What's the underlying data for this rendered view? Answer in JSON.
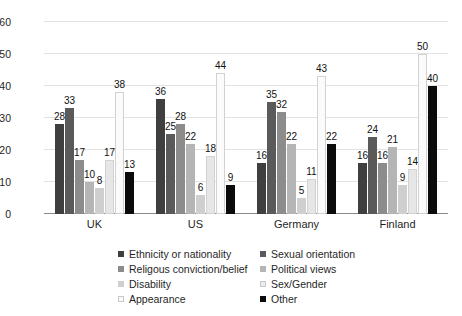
{
  "chart_data": {
    "type": "bar",
    "title": "",
    "subtitle": "",
    "xlabel": "",
    "ylabel": "",
    "ylim": [
      0,
      60
    ],
    "yticks": [
      0,
      10,
      20,
      30,
      40,
      50,
      60
    ],
    "grid": true,
    "legend_position": "bottom",
    "categories": [
      "UK",
      "US",
      "Germany",
      "Finland"
    ],
    "series": [
      {
        "name": "Ethnicity or nationality",
        "color": "#3f3f3f",
        "values": [
          28,
          36,
          16,
          16
        ]
      },
      {
        "name": "Sexual orientation",
        "color": "#5a5a5a",
        "values": [
          33,
          25,
          35,
          24
        ]
      },
      {
        "name": "Religous conviction/belief",
        "color": "#8c8c8c",
        "values": [
          17,
          28,
          32,
          16
        ]
      },
      {
        "name": "Political views",
        "color": "#b5b5b5",
        "values": [
          10,
          22,
          22,
          21
        ]
      },
      {
        "name": "Disability",
        "color": "#cfcfcf",
        "values": [
          8,
          6,
          5,
          9
        ]
      },
      {
        "name": "Sex/Gender",
        "color": "#e6e6e6",
        "values": [
          17,
          18,
          11,
          14
        ]
      },
      {
        "name": "Appearance",
        "color": "#fbfbfb",
        "values": [
          38,
          44,
          43,
          50
        ]
      },
      {
        "name": "Other",
        "color": "#0b0b0b",
        "values": [
          13,
          9,
          22,
          40
        ]
      }
    ]
  },
  "axis": {
    "tick_labels": [
      "60",
      "50",
      "40",
      "30",
      "20",
      "10",
      "0"
    ]
  },
  "legend": {
    "items": [
      {
        "label": "Ethnicity or nationality",
        "color": "#3f3f3f"
      },
      {
        "label": "Sexual orientation",
        "color": "#5a5a5a"
      },
      {
        "label": "Religous conviction/belief",
        "color": "#8c8c8c"
      },
      {
        "label": "Political views",
        "color": "#b5b5b5"
      },
      {
        "label": "Disability",
        "color": "#cfcfcf"
      },
      {
        "label": "Sex/Gender",
        "color": "#ececec"
      },
      {
        "label": "Appearance",
        "color": "#fafafa"
      },
      {
        "label": "Other",
        "color": "#0b0b0b"
      }
    ],
    "order": [
      0,
      1,
      2,
      3,
      4,
      5,
      6,
      7
    ]
  }
}
